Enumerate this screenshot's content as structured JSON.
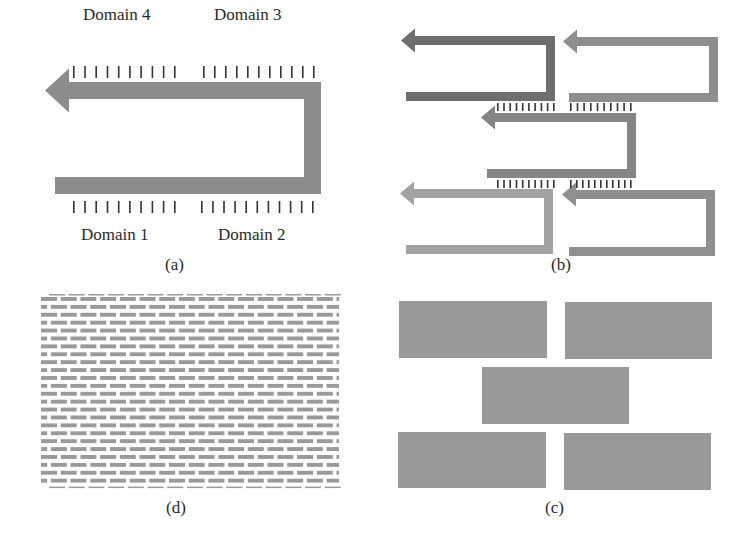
{
  "figure": {
    "panels": [
      {
        "id": "a",
        "caption": "(a)",
        "description": "Single folded (U-turn) arrow with tick marks marking four domains",
        "domains": [
          {
            "label": "Domain 4",
            "position": "top-left",
            "ticks": 10
          },
          {
            "label": "Domain 3",
            "position": "top-right",
            "ticks": 11
          },
          {
            "label": "Domain 1",
            "position": "bottom-left",
            "ticks": 10
          },
          {
            "label": "Domain 2",
            "position": "bottom-right",
            "ticks": 11
          }
        ]
      },
      {
        "id": "b",
        "caption": "(b)",
        "description": "Five folded arrows staggered in brick arrangement, joined by tick marks",
        "arrows": [
          {
            "row": 1,
            "col": 1,
            "color": "#6e6e6e"
          },
          {
            "row": 1,
            "col": 2,
            "color": "#8e8e8e"
          },
          {
            "row": 2,
            "col": 1,
            "color": "#858585"
          },
          {
            "row": 3,
            "col": 1,
            "color": "#a3a3a3"
          },
          {
            "row": 3,
            "col": 2,
            "color": "#8f8f8f"
          }
        ],
        "tick_groups": [
          {
            "between": "row1-col1 / row2",
            "ticks": 10
          },
          {
            "between": "row1-col2 / row2",
            "ticks": 10
          },
          {
            "between": "row2 / row3-col1",
            "ticks": 10
          },
          {
            "between": "row2 / row3-col2",
            "ticks": 11
          }
        ]
      },
      {
        "id": "c",
        "caption": "(c)",
        "description": "Five solid rectangles arranged as a brick pattern (2-1-2)",
        "blocks": 5,
        "color": "#999999"
      },
      {
        "id": "d",
        "caption": "(d)",
        "description": "Dense brick-wall lattice of many small rectangles",
        "rows": 24,
        "bricks_per_row": 16,
        "color": "#9a9a9a"
      }
    ]
  },
  "colors": {
    "arrow_a": "#8c8c8c",
    "tick": "#333333",
    "text": "#2a2a2a",
    "block": "#999999",
    "brick": "#9a9a9a"
  }
}
